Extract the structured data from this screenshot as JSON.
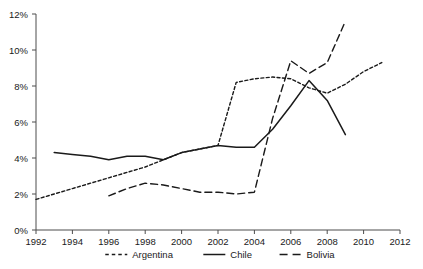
{
  "chart_data": {
    "type": "line",
    "title": "",
    "xlabel": "",
    "ylabel": "",
    "xlim": [
      1992,
      2012
    ],
    "ylim": [
      0,
      12
    ],
    "grid": false,
    "legend_position": "bottom",
    "x_ticks": [
      1992,
      1994,
      1996,
      1998,
      2000,
      2002,
      2004,
      2006,
      2008,
      2010,
      2012
    ],
    "x_tick_labels": [
      "1992",
      "1994",
      "1996",
      "1998",
      "2000",
      "2002",
      "2004",
      "2006",
      "2008",
      "2010",
      "2012"
    ],
    "y_ticks": [
      0,
      2,
      4,
      6,
      8,
      10,
      12
    ],
    "y_tick_labels": [
      "0%",
      "2%",
      "4%",
      "6%",
      "8%",
      "10%",
      "12%"
    ],
    "series": [
      {
        "name": "Argentina",
        "style": "dotted",
        "x": [
          1992,
          1993,
          1994,
          1995,
          1996,
          1997,
          1998,
          1999,
          2000,
          2001,
          2002,
          2003,
          2004,
          2005,
          2006,
          2007,
          2008,
          2009,
          2010,
          2011
        ],
        "values": [
          1.7,
          2.0,
          2.3,
          2.6,
          2.9,
          3.2,
          3.5,
          3.9,
          4.3,
          4.5,
          4.7,
          8.2,
          8.4,
          8.5,
          8.4,
          7.9,
          7.6,
          8.1,
          8.8,
          9.3
        ]
      },
      {
        "name": "Chile",
        "style": "solid",
        "x": [
          1993,
          1994,
          1995,
          1996,
          1997,
          1998,
          1999,
          2000,
          2001,
          2002,
          2003,
          2004,
          2005,
          2006,
          2007,
          2008,
          2009
        ],
        "values": [
          4.3,
          4.2,
          4.1,
          3.9,
          4.1,
          4.1,
          3.9,
          4.3,
          4.5,
          4.7,
          4.6,
          4.6,
          5.6,
          6.9,
          8.3,
          7.2,
          5.3
        ]
      },
      {
        "name": "Bolivia",
        "style": "dashed",
        "x": [
          1996,
          1997,
          1998,
          1999,
          2000,
          2001,
          2002,
          2003,
          2004,
          2005,
          2006,
          2007,
          2008,
          2009
        ],
        "values": [
          1.9,
          2.3,
          2.6,
          2.5,
          2.3,
          2.1,
          2.1,
          2.0,
          2.1,
          6.2,
          9.4,
          8.7,
          9.3,
          11.6
        ]
      }
    ]
  },
  "legend": {
    "items": [
      {
        "label": "Argentina",
        "style": "dotted"
      },
      {
        "label": "Chile",
        "style": "solid"
      },
      {
        "label": "Bolivia",
        "style": "dashed"
      }
    ]
  },
  "colors": {
    "line": "#1a1a1a",
    "axis": "#4d4d4d",
    "background": "#ffffff"
  }
}
